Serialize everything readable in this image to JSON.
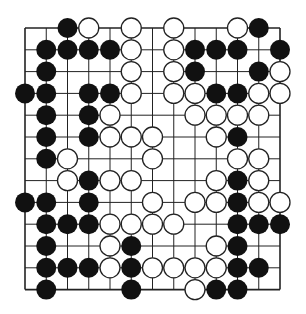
{
  "diagram": {
    "type": "go-board-fragment",
    "grid": {
      "columns": 13,
      "rows": 13,
      "x0": 25,
      "dx": 21.25,
      "y0": 28,
      "dy": 21.8,
      "edges": {
        "left": true,
        "top": true,
        "right": true,
        "bottom": true
      },
      "line_color": "#222222"
    },
    "stone_radius": 10,
    "colors": {
      "black": "#111111",
      "white": "#ffffff",
      "white_outline": "#222222"
    },
    "stones": {
      "black": [
        [
          2,
          0
        ],
        [
          11,
          0
        ],
        [
          1,
          1
        ],
        [
          2,
          1
        ],
        [
          3,
          1
        ],
        [
          4,
          1
        ],
        [
          8,
          1
        ],
        [
          9,
          1
        ],
        [
          10,
          1
        ],
        [
          12,
          1
        ],
        [
          1,
          2
        ],
        [
          8,
          2
        ],
        [
          11,
          2
        ],
        [
          0,
          3
        ],
        [
          1,
          3
        ],
        [
          3,
          3
        ],
        [
          4,
          3
        ],
        [
          9,
          3
        ],
        [
          10,
          3
        ],
        [
          1,
          4
        ],
        [
          3,
          4
        ],
        [
          1,
          5
        ],
        [
          3,
          5
        ],
        [
          10,
          5
        ],
        [
          1,
          6
        ],
        [
          3,
          7
        ],
        [
          10,
          7
        ],
        [
          0,
          8
        ],
        [
          1,
          8
        ],
        [
          3,
          8
        ],
        [
          10,
          8
        ],
        [
          1,
          9
        ],
        [
          2,
          9
        ],
        [
          3,
          9
        ],
        [
          10,
          9
        ],
        [
          11,
          9
        ],
        [
          12,
          9
        ],
        [
          1,
          10
        ],
        [
          5,
          10
        ],
        [
          10,
          10
        ],
        [
          1,
          11
        ],
        [
          2,
          11
        ],
        [
          3,
          11
        ],
        [
          5,
          11
        ],
        [
          10,
          11
        ],
        [
          11,
          11
        ],
        [
          1,
          12
        ],
        [
          5,
          12
        ],
        [
          9,
          12
        ],
        [
          10,
          12
        ]
      ],
      "white": [
        [
          3,
          0
        ],
        [
          5,
          0
        ],
        [
          7,
          0
        ],
        [
          10,
          0
        ],
        [
          5,
          1
        ],
        [
          7,
          1
        ],
        [
          5,
          2
        ],
        [
          7,
          2
        ],
        [
          12,
          2
        ],
        [
          5,
          3
        ],
        [
          7,
          3
        ],
        [
          8,
          3
        ],
        [
          11,
          3
        ],
        [
          12,
          3
        ],
        [
          4,
          4
        ],
        [
          8,
          4
        ],
        [
          9,
          4
        ],
        [
          10,
          4
        ],
        [
          11,
          4
        ],
        [
          4,
          5
        ],
        [
          5,
          5
        ],
        [
          6,
          5
        ],
        [
          9,
          5
        ],
        [
          2,
          6
        ],
        [
          6,
          6
        ],
        [
          10,
          6
        ],
        [
          11,
          6
        ],
        [
          2,
          7
        ],
        [
          4,
          7
        ],
        [
          5,
          7
        ],
        [
          9,
          7
        ],
        [
          11,
          7
        ],
        [
          6,
          8
        ],
        [
          8,
          8
        ],
        [
          9,
          8
        ],
        [
          11,
          8
        ],
        [
          12,
          8
        ],
        [
          4,
          9
        ],
        [
          5,
          9
        ],
        [
          6,
          9
        ],
        [
          7,
          9
        ],
        [
          4,
          10
        ],
        [
          9,
          10
        ],
        [
          4,
          11
        ],
        [
          6,
          11
        ],
        [
          7,
          11
        ],
        [
          8,
          11
        ],
        [
          9,
          11
        ],
        [
          8,
          12
        ]
      ]
    }
  }
}
